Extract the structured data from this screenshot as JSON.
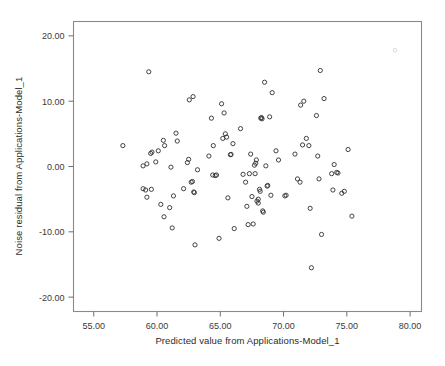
{
  "chart_data": {
    "type": "scatter",
    "title": "",
    "xlabel": "Predicted value from Applications-Model_1",
    "ylabel": "Noise residual from Applications-Model_1",
    "xlim": [
      53.4,
      80.9
    ],
    "ylim": [
      -22.2,
      22.2
    ],
    "xticks": [
      55,
      60,
      65,
      70,
      75,
      80
    ],
    "xtick_labels": [
      "55.00",
      "60.00",
      "65.00",
      "70.00",
      "75.00",
      "80.00"
    ],
    "yticks": [
      20,
      10,
      0,
      -10,
      -20
    ],
    "ytick_labels": [
      "20.00",
      "10.00",
      "0.00",
      "-10.00",
      "-20.00"
    ],
    "grid": false,
    "legend": null,
    "marker": "open-circle",
    "marker_color": "#2f2f2f",
    "frame_color": "#8a8a8a",
    "background": "#ffffff",
    "n_points": 128,
    "points": [
      [
        57.3,
        3.2
      ],
      [
        58.9,
        0.1
      ],
      [
        58.9,
        -3.4
      ],
      [
        59.1,
        -3.6
      ],
      [
        59.2,
        0.4
      ],
      [
        59.2,
        -4.7
      ],
      [
        59.35,
        14.5
      ],
      [
        59.5,
        2.0
      ],
      [
        59.55,
        -3.5
      ],
      [
        59.6,
        2.2
      ],
      [
        59.9,
        0.7
      ],
      [
        60.1,
        2.4
      ],
      [
        60.3,
        -5.8
      ],
      [
        60.5,
        4.0
      ],
      [
        60.55,
        -7.7
      ],
      [
        60.6,
        3.2
      ],
      [
        61.0,
        -6.3
      ],
      [
        61.1,
        -0.1
      ],
      [
        61.2,
        -9.4
      ],
      [
        61.3,
        -4.5
      ],
      [
        61.5,
        5.1
      ],
      [
        61.6,
        3.9
      ],
      [
        62.1,
        -3.4
      ],
      [
        62.4,
        0.6
      ],
      [
        62.5,
        1.1
      ],
      [
        62.55,
        10.2
      ],
      [
        62.7,
        -2.4
      ],
      [
        62.8,
        -2.3
      ],
      [
        62.85,
        10.7
      ],
      [
        62.9,
        -3.9
      ],
      [
        62.95,
        -4.0
      ],
      [
        63.0,
        -12.0
      ],
      [
        63.2,
        -0.5
      ],
      [
        64.1,
        1.6
      ],
      [
        64.3,
        7.4
      ],
      [
        64.4,
        -1.3
      ],
      [
        64.45,
        3.2
      ],
      [
        64.6,
        -1.4
      ],
      [
        64.7,
        -1.3
      ],
      [
        64.9,
        -11.0
      ],
      [
        65.1,
        9.6
      ],
      [
        65.2,
        4.3
      ],
      [
        65.3,
        8.2
      ],
      [
        65.4,
        5.0
      ],
      [
        65.5,
        4.5
      ],
      [
        65.6,
        -4.8
      ],
      [
        65.8,
        1.8
      ],
      [
        65.85,
        1.85
      ],
      [
        66.0,
        3.5
      ],
      [
        66.1,
        -9.5
      ],
      [
        66.6,
        5.8
      ],
      [
        66.8,
        -1.2
      ],
      [
        67.0,
        -2.4
      ],
      [
        67.1,
        -6.1
      ],
      [
        67.2,
        -8.9
      ],
      [
        67.3,
        -1.1
      ],
      [
        67.4,
        1.9
      ],
      [
        67.5,
        -4.6
      ],
      [
        67.6,
        -8.8
      ],
      [
        67.7,
        0.2
      ],
      [
        67.75,
        -1.1
      ],
      [
        67.8,
        0.5
      ],
      [
        67.85,
        1.0
      ],
      [
        67.9,
        -5.3
      ],
      [
        68.0,
        -5.6
      ],
      [
        68.0,
        -5.0
      ],
      [
        68.1,
        -3.5
      ],
      [
        68.15,
        -3.8
      ],
      [
        68.2,
        7.4
      ],
      [
        68.25,
        7.5
      ],
      [
        68.3,
        7.3
      ],
      [
        68.35,
        -6.8
      ],
      [
        68.4,
        -7.0
      ],
      [
        68.5,
        12.9
      ],
      [
        68.6,
        0.1
      ],
      [
        68.7,
        -3.0
      ],
      [
        68.75,
        -2.9
      ],
      [
        68.9,
        7.6
      ],
      [
        69.0,
        -4.4
      ],
      [
        69.1,
        11.3
      ],
      [
        69.4,
        2.4
      ],
      [
        69.6,
        1.0
      ],
      [
        70.1,
        -4.5
      ],
      [
        70.2,
        -4.4
      ],
      [
        70.9,
        1.9
      ],
      [
        71.1,
        -1.9
      ],
      [
        71.3,
        -2.4
      ],
      [
        71.35,
        9.4
      ],
      [
        71.5,
        3.3
      ],
      [
        71.6,
        10.0
      ],
      [
        71.8,
        4.3
      ],
      [
        72.0,
        3.2
      ],
      [
        72.1,
        -6.4
      ],
      [
        72.2,
        -15.5
      ],
      [
        72.6,
        7.8
      ],
      [
        72.7,
        1.6
      ],
      [
        72.8,
        -1.9
      ],
      [
        72.9,
        14.7
      ],
      [
        73.0,
        -10.4
      ],
      [
        73.2,
        10.4
      ],
      [
        73.8,
        -1.1
      ],
      [
        73.9,
        -3.6
      ],
      [
        74.0,
        0.3
      ],
      [
        74.2,
        -0.9
      ],
      [
        74.3,
        -1.0
      ],
      [
        74.6,
        -4.1
      ],
      [
        74.8,
        -3.8
      ],
      [
        75.1,
        2.6
      ],
      [
        75.4,
        -7.6
      ]
    ],
    "faint_points": [
      [
        78.8,
        17.8
      ]
    ]
  }
}
